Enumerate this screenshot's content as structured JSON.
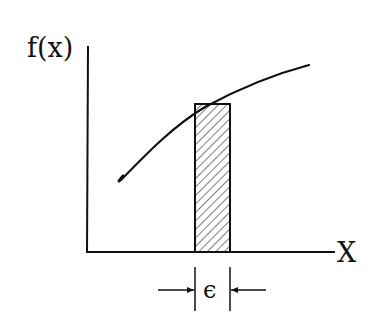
{
  "diagram": {
    "type": "function-integral-strip",
    "y_axis_label": "f(x)",
    "x_axis_label": "X",
    "strip_width_label": "ϵ",
    "colors": {
      "ink": "#111111",
      "background": "#ffffff"
    },
    "axes": {
      "origin": [
        87,
        252
      ],
      "y_axis_top": [
        88,
        46
      ],
      "x_axis_right": [
        335,
        252
      ]
    },
    "curve": {
      "description": "increasing concave function f(x)",
      "points": [
        [
          121,
          179
        ],
        [
          150,
          150
        ],
        [
          195,
          112
        ],
        [
          240,
          88
        ],
        [
          280,
          74
        ],
        [
          309,
          65
        ]
      ]
    },
    "strip": {
      "description": "hatched rectangle of width epsilon under the curve",
      "x_left": 195,
      "x_right": 230,
      "y_top": 104,
      "y_bottom": 252,
      "fill": "diagonal-hatch"
    },
    "epsilon_marker": {
      "y": 290,
      "tick_top": 267,
      "tick_bottom": 311,
      "left_arrow_start": 158,
      "right_arrow_start": 265
    }
  }
}
